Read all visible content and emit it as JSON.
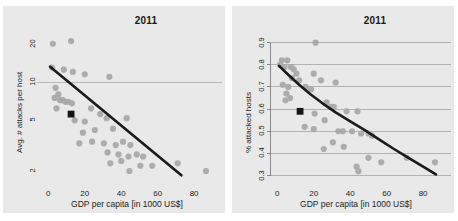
{
  "figure": {
    "background": "#ffffff",
    "panel_background": "#e9e9e9",
    "point_color": "#a9a9a9",
    "line_color": "#1a1a1a",
    "highlight_color": "#141414",
    "grid_color": "#9a9a9a"
  },
  "panels": [
    {
      "id": "left",
      "title": "2011",
      "xlabel": "GDP per capita [in 1000 US$]",
      "ylabel": "Avg. # attacks per host",
      "xticks": [
        "0",
        "20",
        "40",
        "60",
        "80"
      ],
      "yticks": [
        "20",
        "10",
        "5",
        "2"
      ]
    },
    {
      "id": "right",
      "title": "2011",
      "xlabel": "GDP per capita [in 1000 US$]",
      "ylabel": "% attacked hosts",
      "xticks": [
        "0",
        "20",
        "40",
        "60",
        "80"
      ],
      "yticks": [
        "0.9",
        "0.8",
        "0.7",
        "0.6",
        "0.5",
        "0.4",
        "0.3"
      ]
    }
  ],
  "chart_data": [
    {
      "type": "scatter",
      "panel": "left",
      "title": "2011",
      "xlabel": "GDP per capita [in 1000 US$]",
      "ylabel": "Avg. # attacks per host",
      "xlim": [
        -4,
        92
      ],
      "ylim": [
        1.7,
        23
      ],
      "yscale": "log",
      "xticks": [
        0,
        20,
        40,
        60,
        80
      ],
      "yticks": [
        20,
        10,
        5,
        2
      ],
      "grid": "horizontal-at-10",
      "legend": null,
      "points": [
        {
          "x": 2.5,
          "y": 20.0
        },
        {
          "x": 12.5,
          "y": 21.0
        },
        {
          "x": 2.0,
          "y": 13.0
        },
        {
          "x": 8.5,
          "y": 12.5
        },
        {
          "x": 13.5,
          "y": 12.0
        },
        {
          "x": 20.0,
          "y": 11.5
        },
        {
          "x": 33.5,
          "y": 11.0
        },
        {
          "x": 4.0,
          "y": 9.0
        },
        {
          "x": 5.5,
          "y": 8.0
        },
        {
          "x": 3.5,
          "y": 7.5
        },
        {
          "x": 6.5,
          "y": 7.2
        },
        {
          "x": 8.0,
          "y": 7.2
        },
        {
          "x": 9.5,
          "y": 7.0
        },
        {
          "x": 11.0,
          "y": 7.0
        },
        {
          "x": 4.5,
          "y": 6.2
        },
        {
          "x": 13.0,
          "y": 6.8
        },
        {
          "x": 23.5,
          "y": 6.2
        },
        {
          "x": 28.5,
          "y": 5.6
        },
        {
          "x": 14.5,
          "y": 5.0
        },
        {
          "x": 20.0,
          "y": 4.9
        },
        {
          "x": 32.0,
          "y": 5.2
        },
        {
          "x": 43.0,
          "y": 5.2
        },
        {
          "x": 19.0,
          "y": 4.0
        },
        {
          "x": 25.5,
          "y": 4.2
        },
        {
          "x": 35.5,
          "y": 4.3
        },
        {
          "x": 17.0,
          "y": 3.3
        },
        {
          "x": 24.0,
          "y": 3.4
        },
        {
          "x": 30.5,
          "y": 3.3
        },
        {
          "x": 37.0,
          "y": 3.2
        },
        {
          "x": 41.0,
          "y": 3.4
        },
        {
          "x": 45.0,
          "y": 3.2
        },
        {
          "x": 32.5,
          "y": 2.8
        },
        {
          "x": 38.5,
          "y": 2.7
        },
        {
          "x": 44.0,
          "y": 2.6
        },
        {
          "x": 48.5,
          "y": 2.7
        },
        {
          "x": 52.0,
          "y": 2.6
        },
        {
          "x": 34.0,
          "y": 2.3
        },
        {
          "x": 40.0,
          "y": 2.4
        },
        {
          "x": 44.5,
          "y": 2.0
        },
        {
          "x": 50.5,
          "y": 2.2
        },
        {
          "x": 57.0,
          "y": 2.2
        },
        {
          "x": 71.0,
          "y": 2.3
        },
        {
          "x": 86.5,
          "y": 2.0
        }
      ],
      "highlight_point": {
        "x": 12.5,
        "y": 5.6,
        "marker": "square",
        "color": "#141414"
      },
      "trend_line": {
        "style": "straight-on-log-y",
        "points": [
          {
            "x": 1.0,
            "y": 13.2
          },
          {
            "x": 73.0,
            "y": 1.85
          }
        ],
        "color": "#1a1a1a",
        "width": 2.6
      }
    },
    {
      "type": "scatter",
      "panel": "right",
      "title": "2011",
      "xlabel": "GDP per capita [in 1000 US$]",
      "ylabel": "% attacked hosts",
      "xlim": [
        -4,
        92
      ],
      "ylim": [
        0.28,
        0.93
      ],
      "yscale": "linear",
      "xticks": [
        0,
        20,
        40,
        60,
        80
      ],
      "yticks": [
        0.9,
        0.8,
        0.7,
        0.6,
        0.5,
        0.4,
        0.3
      ],
      "grid": "horizontal",
      "legend": null,
      "points": [
        {
          "x": 21.0,
          "y": 0.9
        },
        {
          "x": 2.5,
          "y": 0.82
        },
        {
          "x": 5.5,
          "y": 0.82
        },
        {
          "x": 1.5,
          "y": 0.8
        },
        {
          "x": 4.0,
          "y": 0.79
        },
        {
          "x": 7.5,
          "y": 0.79
        },
        {
          "x": 9.0,
          "y": 0.78
        },
        {
          "x": 10.5,
          "y": 0.76
        },
        {
          "x": 20.0,
          "y": 0.76
        },
        {
          "x": 8.0,
          "y": 0.74
        },
        {
          "x": 12.0,
          "y": 0.73
        },
        {
          "x": 32.0,
          "y": 0.72
        },
        {
          "x": 3.0,
          "y": 0.71
        },
        {
          "x": 6.0,
          "y": 0.7
        },
        {
          "x": 15.5,
          "y": 0.7
        },
        {
          "x": 18.5,
          "y": 0.69
        },
        {
          "x": 24.0,
          "y": 0.73
        },
        {
          "x": 5.0,
          "y": 0.67
        },
        {
          "x": 7.0,
          "y": 0.65
        },
        {
          "x": 4.5,
          "y": 0.64
        },
        {
          "x": 27.0,
          "y": 0.63
        },
        {
          "x": 29.5,
          "y": 0.61
        },
        {
          "x": 31.0,
          "y": 0.61
        },
        {
          "x": 38.0,
          "y": 0.59
        },
        {
          "x": 44.0,
          "y": 0.59
        },
        {
          "x": 20.5,
          "y": 0.58
        },
        {
          "x": 26.0,
          "y": 0.55
        },
        {
          "x": 15.0,
          "y": 0.52
        },
        {
          "x": 20.0,
          "y": 0.51
        },
        {
          "x": 33.5,
          "y": 0.5
        },
        {
          "x": 36.0,
          "y": 0.5
        },
        {
          "x": 41.0,
          "y": 0.5
        },
        {
          "x": 46.0,
          "y": 0.49
        },
        {
          "x": 50.0,
          "y": 0.49
        },
        {
          "x": 52.0,
          "y": 0.48
        },
        {
          "x": 30.5,
          "y": 0.45
        },
        {
          "x": 36.5,
          "y": 0.43
        },
        {
          "x": 25.5,
          "y": 0.42
        },
        {
          "x": 50.0,
          "y": 0.38
        },
        {
          "x": 71.0,
          "y": 0.38
        },
        {
          "x": 57.0,
          "y": 0.36
        },
        {
          "x": 86.5,
          "y": 0.36
        },
        {
          "x": 43.5,
          "y": 0.34
        },
        {
          "x": 44.5,
          "y": 0.32
        }
      ],
      "highlight_point": {
        "x": 12.5,
        "y": 0.59,
        "marker": "square",
        "color": "#141414"
      },
      "trend_line": {
        "style": "exponential-decay",
        "points": [
          {
            "x": 1.0,
            "y": 0.795
          },
          {
            "x": 6.0,
            "y": 0.755
          },
          {
            "x": 12.0,
            "y": 0.71
          },
          {
            "x": 18.0,
            "y": 0.668
          },
          {
            "x": 25.0,
            "y": 0.625
          },
          {
            "x": 32.0,
            "y": 0.585
          },
          {
            "x": 40.0,
            "y": 0.545
          },
          {
            "x": 48.0,
            "y": 0.505
          },
          {
            "x": 56.0,
            "y": 0.462
          },
          {
            "x": 64.0,
            "y": 0.42
          },
          {
            "x": 72.0,
            "y": 0.38
          },
          {
            "x": 80.0,
            "y": 0.34
          },
          {
            "x": 87.0,
            "y": 0.305
          }
        ],
        "color": "#1a1a1a",
        "width": 2.6
      }
    }
  ]
}
